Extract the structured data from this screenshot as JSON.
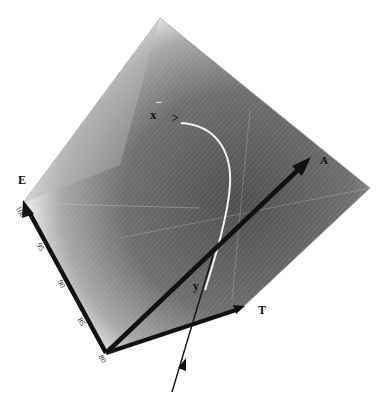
{
  "figure": {
    "type": "3d-cube-diagram",
    "axes": {
      "E": {
        "label": "E",
        "ticks": [
          "100",
          "95",
          "90",
          "85",
          "80"
        ]
      },
      "T": {
        "label": "T"
      },
      "A": {
        "label": "A"
      }
    },
    "curve_labels": {
      "x": "x",
      "y": "y",
      "caret": ">",
      "dash": "–"
    },
    "colors": {
      "background": "#ffffff",
      "cube_fill_dark": "#5a5a5a",
      "cube_fill_light": "#d8d8d8",
      "axis": "#111111",
      "curve": "#f2f2f2"
    }
  }
}
